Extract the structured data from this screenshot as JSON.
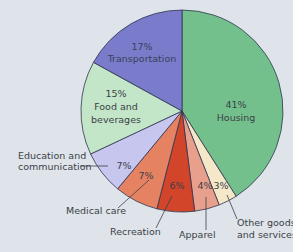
{
  "chart_data": {
    "type": "pie",
    "title": "",
    "start_angle": "12 o'clock, clockwise",
    "categories": [
      "Housing",
      "Other goods and services",
      "Apparel",
      "Recreation",
      "Medical care",
      "Education and communication",
      "Food and beverages",
      "Transportation"
    ],
    "values": [
      41,
      3,
      4,
      6,
      7,
      7,
      15,
      17
    ],
    "unit": "%",
    "colors": [
      "#74c08d",
      "#f4e8c8",
      "#e8a08c",
      "#d2452a",
      "#e58262",
      "#c6c6ee",
      "#c4e6c8",
      "#7a7ccb"
    ],
    "slice_labels": [
      "41%",
      "3%",
      "4%",
      "6%",
      "7%",
      "7%",
      "15%",
      "17%"
    ],
    "legend": "none (callout labels)"
  },
  "labels": {
    "housing": [
      "41%",
      "Housing"
    ],
    "transportation": [
      "17%",
      "Transportation"
    ],
    "food": [
      "15%",
      "Food and",
      "beverages"
    ],
    "education_pct": "7%",
    "medical_pct": "7%",
    "recreation_pct": "6%",
    "apparel_pct": "4%",
    "other_pct": "3%",
    "education_callout": [
      "Education and",
      "communication"
    ],
    "medical_callout": "Medical care",
    "recreation_callout": "Recreation",
    "apparel_callout": "Apparel",
    "other_callout": [
      "Other goods",
      "and services"
    ]
  },
  "style": {
    "background": "#dfe4ea",
    "outline": "#2f3550"
  }
}
